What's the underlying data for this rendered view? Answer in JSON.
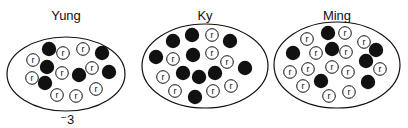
{
  "diagram": {
    "groups": [
      {
        "name": "Yung",
        "caption": "⁻3",
        "ellipse": {
          "cx": 66,
          "cy": 74,
          "rx": 59,
          "ry": 37
        },
        "label_pos": [
          66,
          20
        ],
        "filled": [
          [
            49,
            49
          ],
          [
            47,
            67
          ],
          [
            45,
            83
          ],
          [
            79,
            75
          ],
          [
            102,
            53
          ],
          [
            109,
            72
          ]
        ],
        "r": [
          [
            63,
            53
          ],
          [
            83,
            49
          ],
          [
            33,
            60
          ],
          [
            32,
            78
          ],
          [
            62,
            73
          ],
          [
            92,
            68
          ],
          [
            57,
            95
          ],
          [
            76,
            96
          ],
          [
            96,
            89
          ]
        ]
      },
      {
        "name": "Ky",
        "caption": "",
        "ellipse": {
          "cx": 205,
          "cy": 66,
          "rx": 63,
          "ry": 42
        },
        "label_pos": [
          205,
          20
        ],
        "filled": [
          [
            173,
            41
          ],
          [
            192,
            35
          ],
          [
            230,
            41
          ],
          [
            156,
            57
          ],
          [
            193,
            55
          ],
          [
            183,
            73
          ],
          [
            199,
            77
          ],
          [
            215,
            73
          ],
          [
            245,
            68
          ],
          [
            195,
            97
          ]
        ],
        "r": [
          [
            212,
            35
          ],
          [
            173,
            59
          ],
          [
            212,
            53
          ],
          [
            227,
            62
          ],
          [
            163,
            77
          ],
          [
            175,
            91
          ],
          [
            213,
            91
          ],
          [
            231,
            86
          ]
        ]
      },
      {
        "name": "Ming",
        "caption": "",
        "ellipse": {
          "cx": 337,
          "cy": 65,
          "rx": 63,
          "ry": 43
        },
        "label_pos": [
          337,
          20
        ],
        "filled": [
          [
            328,
            33
          ],
          [
            293,
            53
          ],
          [
            332,
            49
          ],
          [
            376,
            50
          ],
          [
            366,
            61
          ],
          [
            321,
            81
          ],
          [
            368,
            82
          ]
        ],
        "r": [
          [
            307,
            39
          ],
          [
            345,
            33
          ],
          [
            364,
            42
          ],
          [
            316,
            53
          ],
          [
            346,
            52
          ],
          [
            290,
            72
          ],
          [
            308,
            69
          ],
          [
            332,
            67
          ],
          [
            348,
            72
          ],
          [
            380,
            69
          ],
          [
            303,
            86
          ],
          [
            329,
            96
          ],
          [
            349,
            92
          ]
        ]
      }
    ],
    "r_label": "r",
    "colors": {
      "ink": "#111111",
      "background": "#ffffff"
    }
  }
}
